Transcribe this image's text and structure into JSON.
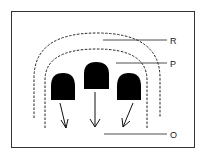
{
  "diagram": {
    "labels": {
      "r": "R",
      "p": "P",
      "o": "O"
    },
    "colors": {
      "stroke": "#2a2a2a",
      "fill": "#000000",
      "background": "#ffffff"
    }
  }
}
